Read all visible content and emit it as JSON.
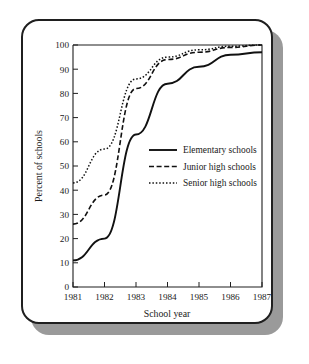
{
  "figure": {
    "frame_style": "rounded-card-with-drop-shadow",
    "border_color": "#1f1f1f",
    "shadow_color": "#9a9a9a",
    "background_color": "#ffffff"
  },
  "chart_data": {
    "type": "line",
    "title": "",
    "subtitle": "",
    "xlabel": "School year",
    "ylabel": "Percent of schools",
    "x": [
      1981,
      1982,
      1983,
      1984,
      1985,
      1986,
      1987
    ],
    "xtick_labels": [
      "1981",
      "1982",
      "1983",
      "1984",
      "1985",
      "1986",
      "1987"
    ],
    "ytick_labels": [
      "0",
      "10",
      "20",
      "30",
      "40",
      "50",
      "60",
      "70",
      "80",
      "90",
      "100"
    ],
    "ytick_values": [
      0,
      10,
      20,
      30,
      40,
      50,
      60,
      70,
      80,
      90,
      100
    ],
    "xlim": [
      1981,
      1987
    ],
    "ylim": [
      0,
      100
    ],
    "grid": false,
    "legend_position": "center-right-inside",
    "series": [
      {
        "name": "Elementary schools",
        "style": "solid",
        "color": "#111111",
        "values": [
          11,
          20,
          63,
          84,
          91,
          96,
          97
        ]
      },
      {
        "name": "Junior high schools",
        "style": "dashed",
        "color": "#111111",
        "values": [
          26,
          38,
          82,
          94,
          97,
          99,
          100
        ]
      },
      {
        "name": "Senior high schools",
        "style": "dotted",
        "color": "#111111",
        "values": [
          43,
          57,
          86,
          95,
          98,
          99.5,
          100
        ]
      }
    ],
    "legend": [
      "Elementary schools",
      "Junior high schools",
      "Senior high schools"
    ]
  }
}
